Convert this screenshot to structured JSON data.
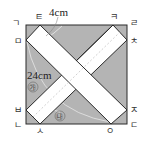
{
  "figure": {
    "type": "geometry-diagram",
    "colors": {
      "background": "#ffffff",
      "shaded_region": "#b4b4b4",
      "strip": "#ffffff",
      "outline": "#2a2a2a"
    },
    "measurements": {
      "strip_width": "4cm",
      "length_label": "24cm"
    },
    "vertex_labels": {
      "top_left_corner": "ㄱ",
      "top_strip1": "ㅌ",
      "top_strip2": "ㅋ",
      "top_right_corner": "ㄹ",
      "left_upper": "ㅁ",
      "right_upper": "ㅊ",
      "left_lower": "ㅂ",
      "right_lower": "ㅈ",
      "bottom_left_corner": "ㄴ",
      "bottom_strip2": "ㅅ",
      "bottom_strip1": "ㅇ",
      "bottom_right_corner": "ㄷ"
    },
    "region_labels": {
      "ga": "㉮",
      "na": "㉯"
    }
  }
}
